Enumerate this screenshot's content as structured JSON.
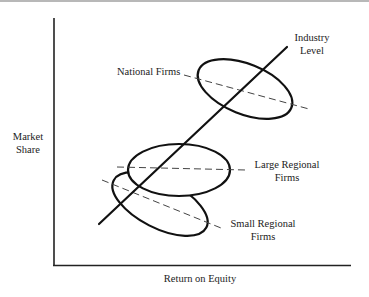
{
  "diagram": {
    "type": "conceptual-scatter",
    "axes": {
      "ylabel_line1": "Market",
      "ylabel_line2": "Share",
      "xlabel": "Return on Equity"
    },
    "industry_line": {
      "label_line1": "Industry",
      "label_line2": "Level"
    },
    "groups": [
      {
        "name": "National Firms",
        "label_line1": "National Firms"
      },
      {
        "name": "Large Regional Firms",
        "label_line1": "Large Regional",
        "label_line2": "Firms"
      },
      {
        "name": "Small Regional Firms",
        "label_line1": "Small Regional",
        "label_line2": "Firms"
      }
    ]
  },
  "colors": {
    "ink": "#111111",
    "dash": "#444444",
    "background": "#ffffff"
  }
}
